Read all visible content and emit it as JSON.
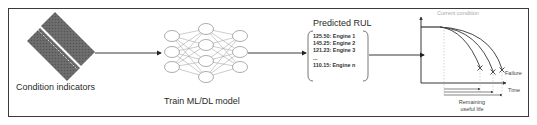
{
  "diagram": {
    "stages": [
      {
        "id": "condition-indicators",
        "label": "Condition indicators"
      },
      {
        "id": "train-model",
        "label": "Train ML/DL model"
      },
      {
        "id": "predicted-rul",
        "label": "Predicted RUL",
        "entries": [
          "125.50: Engine 1",
          "145.25: Engine 2",
          "121.23: Engine 3",
          "...",
          "110.15: Engine n"
        ]
      },
      {
        "id": "degradation-graph",
        "annotations": {
          "current": "Current condition",
          "failure": "Failure",
          "x_axis": "Time",
          "rul_line1": "Remaining",
          "rul_line2": "useful life"
        }
      }
    ],
    "neural_network_layers": [
      3,
      4,
      3
    ],
    "colors": {
      "border": "#3a3a3a",
      "matrix_fill": "#6e6e6e",
      "node_stroke": "#8a8a8a",
      "muted_text": "#a8a8a8"
    }
  }
}
